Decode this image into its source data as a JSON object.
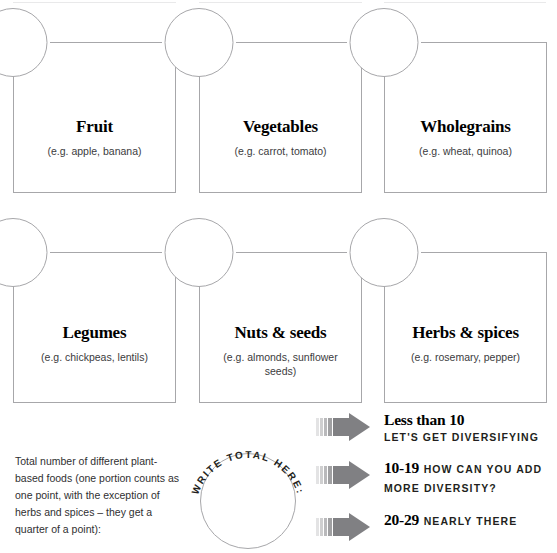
{
  "cards": [
    {
      "title": "Fruit",
      "sub": "(e.g. apple, banana)"
    },
    {
      "title": "Vegetables",
      "sub": "(e.g. carrot, tomato)"
    },
    {
      "title": "Wholegrains",
      "sub": "(e.g. wheat, quinoa)"
    },
    {
      "title": "Legumes",
      "sub": "(e.g. chickpeas, lentils)"
    },
    {
      "title": "Nuts & seeds",
      "sub": "(e.g. almonds, sunflower seeds)"
    },
    {
      "title": "Herbs & spices",
      "sub": "(e.g. rosemary, pepper)"
    }
  ],
  "total": {
    "instructions": "Total number of different plant-based foods (one portion counts as one point, with the exception of herbs and spices – they get a quarter of a point):",
    "circle_label": "WRITE TOTAL HERE:",
    "value": ""
  },
  "score_legend": [
    {
      "range": "Less than 10",
      "message": "LET'S GET DIVERSIFYING"
    },
    {
      "range": "10-19",
      "message": "HOW CAN YOU ADD MORE DIVERSITY?"
    },
    {
      "range": "20-29",
      "message": "NEARLY THERE"
    }
  ],
  "colors": {
    "outline": "#a7a7aa",
    "arrow": "#808083",
    "text": "#231f20",
    "background": "#ffffff"
  }
}
